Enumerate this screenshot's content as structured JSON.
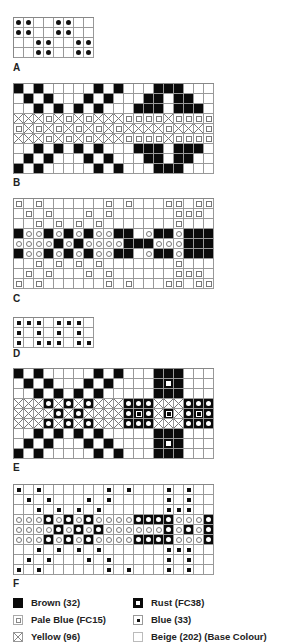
{
  "charts": [
    {
      "id": "A",
      "label": "A",
      "cols": 8,
      "rows": [
        "KK..KK..",
        "KK..KK..",
        "..KK..KK",
        "..KK..KK"
      ]
    },
    {
      "id": "B",
      "label": "B",
      "cols": 20,
      "rows": [
        "B.B.....B.B...BBB...",
        ".B.B...B.B...BB.BB..",
        "..B.B.B.B...BBB.BBB.",
        "XXXPXPXPXXXPPPPXPPPP",
        "PXPXPXPXPXPXXXXPXXXP",
        "XXXPXPXPXXXPPPPXPPPP",
        "..B.B.B.B...BBB.BBB.",
        ".B.B...B.B...BB.BB..",
        "B.B.....B.B...BBB..."
      ]
    },
    {
      "id": "C",
      "label": "C",
      "cols": 20,
      "rows": [
        "P.P......P.P...PP.PP",
        ".P.P...P.P......PPP.",
        "..P.P.P.P.......P...",
        "BOOBOBOBOOBB.OBBOBBB",
        "OOOOBOBOOOOBBBOOOBBB",
        "BOOBOBOBOOBB.OBBOBBB",
        "..P.P.P.P.......P...",
        ".P.P...P.P......PPP.",
        "P.P......P.P...PP.PP"
      ]
    },
    {
      "id": "D",
      "label": "D",
      "cols": 8,
      "rows": [
        "DDD.DDD.",
        "D.D.D.D.",
        "D.DDD.DD"
      ]
    },
    {
      "id": "E",
      "label": "E",
      "cols": 20,
      "rows": [
        "B.B.....B.B...BBB...",
        ".B.B...B.B....BSB...",
        "..B.B.B.B.....BBB...",
        "XXXRXRXRXXXRRRXXXRRR",
        "XXXXRXRXXXXRQRXQXRQR",
        "XXXRXRXRXXXRRRXXXRRR",
        "..B.B.B.B.....BBB...",
        ".B.B...B.B....BSB...",
        "B.B.....B.B...BBB..."
      ]
    },
    {
      "id": "F",
      "label": "F",
      "cols": 20,
      "rows": [
        "D.D......D.D...D.D..",
        ".D.D...D.D.....D.D..",
        "..D.D.D.D......DDD..",
        "OOORORORoOOORRRROOORRR",
        "OOOORORORoOOOOOROROROO",
        "OOORORORoOOORRRROOORRR",
        "..D.D.D.D......DDD..",
        ".D.D...D.D.....D.D..",
        "D.D......D.D...D.D.."
      ]
    }
  ],
  "legend": [
    {
      "swatch": "brown",
      "label": "Brown (32)"
    },
    {
      "swatch": "rust",
      "label": "Rust (FC38)"
    },
    {
      "swatch": "pale",
      "label": "Pale Blue (FC15)"
    },
    {
      "swatch": "blue",
      "label": "Blue (33)"
    },
    {
      "swatch": "yellow",
      "label": "Yellow (96)"
    },
    {
      "swatch": "beige",
      "label": "Beige (202) (Base Colour)"
    }
  ],
  "layout": {
    "A": {
      "top": 17,
      "labelTop": 62
    },
    "B": {
      "top": 83,
      "labelTop": 177
    },
    "C": {
      "top": 198,
      "labelTop": 293
    },
    "D": {
      "top": 317,
      "labelTop": 348
    },
    "E": {
      "top": 368,
      "labelTop": 462
    },
    "F": {
      "top": 484,
      "labelTop": 578
    }
  }
}
